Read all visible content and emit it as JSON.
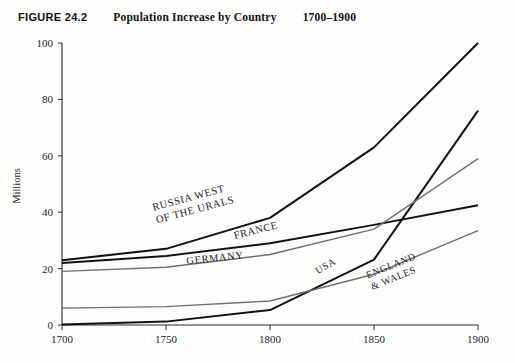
{
  "caption": {
    "figure_number": "FIGURE 24.2",
    "title": "Population Increase by Country",
    "range": "1700–1900"
  },
  "axes": {
    "y_axis_title": "Millions",
    "y_ticks": [
      "0",
      "20",
      "40",
      "60",
      "80",
      "100"
    ],
    "x_ticks": [
      "1700",
      "1750",
      "1800",
      "1850",
      "1900"
    ]
  },
  "labels": {
    "russia_line1": "RUSSIA WEST",
    "russia_line2": "OF THE URALS",
    "france": "FRANCE",
    "germany": "GERMANY",
    "usa": "USA",
    "england_line1": "ENGLAND",
    "england_line2": "& WALES"
  },
  "colors": {
    "dark_line": "#111111",
    "mid_line": "#6f6f6f",
    "axis": "#2b2b2b",
    "background": "#fdfdfc"
  },
  "chart_data": {
    "type": "line",
    "title": "Population Increase by Country",
    "subtitle": "1700–1900",
    "xlabel": "",
    "ylabel": "Millions",
    "x": [
      1700,
      1750,
      1800,
      1850,
      1900
    ],
    "xlim": [
      1700,
      1900
    ],
    "ylim": [
      0,
      100
    ],
    "grid": false,
    "legend": "inline-labels",
    "series": [
      {
        "name": "USA",
        "values": [
          0.2,
          1.2,
          5.3,
          23.2,
          76.0
        ],
        "style": "dark",
        "label_x": 1822,
        "label_y": 18
      },
      {
        "name": "RUSSIA WEST OF THE URALS",
        "values": [
          23.0,
          27.0,
          38.0,
          63.0,
          100.0
        ],
        "style": "dark",
        "label_x": 1744,
        "label_y": 40
      },
      {
        "name": "FRANCE",
        "values": [
          22.0,
          24.5,
          29.0,
          35.5,
          42.5
        ],
        "style": "dark",
        "label_x": 1782,
        "label_y": 31
      },
      {
        "name": "GERMANY",
        "values": [
          19.0,
          20.5,
          25.0,
          34.0,
          59.0
        ],
        "style": "mid",
        "label_x": 1760,
        "label_y": 22
      },
      {
        "name": "ENGLAND & WALES",
        "values": [
          6.0,
          6.5,
          8.5,
          18.0,
          33.5
        ],
        "style": "mid",
        "label_x": 1850,
        "label_y": 17
      }
    ]
  }
}
